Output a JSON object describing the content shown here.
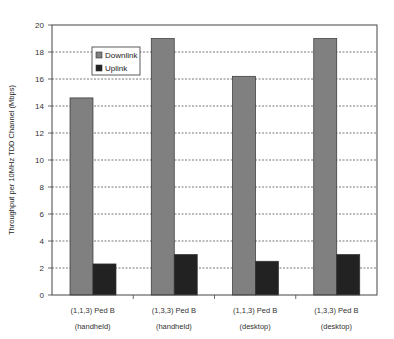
{
  "chart_data": {
    "type": "bar",
    "title": "",
    "xlabel": "",
    "ylabel": "Throughput per 10MHz TDD Channel (Mbps)",
    "ylim": [
      0,
      20
    ],
    "yticks": [
      0,
      2,
      4,
      6,
      8,
      10,
      12,
      14,
      16,
      18,
      20
    ],
    "grid": true,
    "legend_position": "upper-left-inside",
    "categories": [
      [
        "(1,1,3) Ped B",
        "(handheld)"
      ],
      [
        "(1,3,3) Ped B",
        "(handheld)"
      ],
      [
        "(1,1,3) Ped B",
        "(desktop)"
      ],
      [
        "(1,3,3) Ped B",
        "(desktop)"
      ]
    ],
    "series": [
      {
        "name": "Downlink",
        "color": "#808080",
        "values": [
          14.6,
          19.0,
          16.2,
          19.0
        ]
      },
      {
        "name": "Uplink",
        "color": "#222222",
        "values": [
          2.3,
          3.0,
          2.5,
          3.0
        ]
      }
    ]
  }
}
